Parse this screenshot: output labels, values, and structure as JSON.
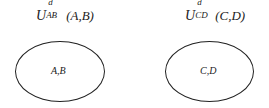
{
  "diagram": {
    "sets": [
      {
        "label": {
          "symbol": "U",
          "superscript": "d",
          "subscript": "AB",
          "args": "(A,B)"
        },
        "content": "A,B"
      },
      {
        "label": {
          "symbol": "U",
          "superscript": "d",
          "subscript": "CD",
          "args": "(C,D)"
        },
        "content": "C,D"
      }
    ]
  }
}
